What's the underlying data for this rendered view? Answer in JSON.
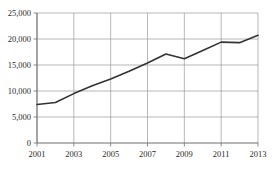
{
  "chart_data": {
    "type": "line",
    "title": "",
    "subtitle": "",
    "xlabel": "",
    "ylabel": "",
    "x": [
      2001,
      2002,
      2003,
      2004,
      2005,
      2006,
      2007,
      2008,
      2009,
      2010,
      2011,
      2012,
      2013
    ],
    "values": [
      7400,
      7800,
      9500,
      11000,
      12300,
      13800,
      15400,
      17100,
      16200,
      17800,
      19400,
      19300,
      20700
    ],
    "series": [
      {
        "name": "series-1",
        "color": "#333333",
        "values": [
          7400,
          7800,
          9500,
          11000,
          12300,
          13800,
          15400,
          17100,
          16200,
          17800,
          19400,
          19300,
          20700
        ]
      }
    ],
    "xlim": [
      2001,
      2013
    ],
    "ylim": [
      0,
      25000
    ],
    "xticks": [
      2001,
      2003,
      2005,
      2007,
      2009,
      2011,
      2013
    ],
    "xtick_labels": [
      "2001",
      "2003",
      "2005",
      "2007",
      "2009",
      "2011",
      "2013"
    ],
    "yticks": [
      0,
      5000,
      10000,
      15000,
      20000,
      25000
    ],
    "ytick_labels": [
      "0",
      "5,000",
      "10,000",
      "15,000",
      "20,000",
      "25,000"
    ],
    "grid": true,
    "grid_color": "#9a9a9a",
    "axis_color": "#6e6e6e",
    "legend": false,
    "legend_position": "none",
    "annotations": []
  }
}
